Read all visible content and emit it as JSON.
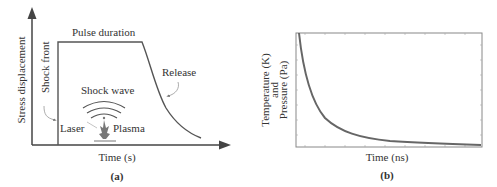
{
  "panel_a": {
    "caption": "(a)",
    "ylabel": "Stress displacement",
    "xlabel": "Time (s)",
    "annotations": {
      "pulse_duration": "Pulse duration",
      "shock_front": "Shock front",
      "release": "Release",
      "shock_wave": "Shock wave",
      "laser": "Laser",
      "plasma": "Plasma"
    }
  },
  "panel_b": {
    "caption": "(b)",
    "ylabel_line1": "Pressure (Pa)",
    "ylabel_line2": "and",
    "ylabel_line3": "Temperature (K)",
    "xlabel": "Time (ns)"
  },
  "colors": {
    "line": "#555555",
    "curve_b": "#666666",
    "text": "#333333"
  }
}
